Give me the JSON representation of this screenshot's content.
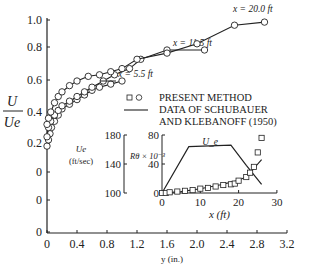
{
  "chart_data": [
    {
      "type": "line",
      "title": "",
      "xlabel": "y (in.)",
      "ylabel": "U / U_e",
      "xlim": [
        0,
        3.2
      ],
      "ylim": [
        0,
        1.0
      ],
      "x_ticks": [
        "0",
        "0.4",
        "0.8",
        "1.2",
        "1.6",
        "2.0",
        "2.4",
        "2.8",
        "3.2"
      ],
      "y_ticks": [
        "1.0",
        "0.8",
        "0.6",
        "0.4",
        "0.2",
        "0",
        "0",
        "0"
      ],
      "grid": false,
      "legend": {
        "position": "right-middle",
        "entries": [
          {
            "symbol": "□,○",
            "label": "PRESENT METHOD"
          },
          {
            "symbol": "line",
            "label": "DATA OF SCHUBAUER AND KLEBANOFF (1950)"
          }
        ]
      },
      "series": [
        {
          "name": "x = 5.5 ft",
          "annotation": "x = 5.5 ft",
          "x": [
            0.0,
            0.02,
            0.04,
            0.06,
            0.1,
            0.15,
            0.2,
            0.3,
            0.4,
            0.5,
            0.6,
            0.7,
            0.85,
            1.0
          ],
          "y": [
            0.18,
            0.22,
            0.26,
            0.3,
            0.34,
            0.38,
            0.42,
            0.45,
            0.48,
            0.51,
            0.54,
            0.56,
            0.58,
            0.6
          ]
        },
        {
          "name": "x = 11.5 ft",
          "annotation": "x = 11.5 ft",
          "x": [
            0.0,
            0.02,
            0.05,
            0.1,
            0.15,
            0.2,
            0.3,
            0.4,
            0.5,
            0.6,
            0.75,
            0.9,
            1.1,
            1.25,
            1.6,
            2.1
          ],
          "y": [
            0.24,
            0.3,
            0.34,
            0.38,
            0.41,
            0.44,
            0.47,
            0.5,
            0.53,
            0.56,
            0.6,
            0.64,
            0.68,
            0.74,
            0.8,
            0.8
          ]
        },
        {
          "name": "x = 20.0 ft",
          "annotation": "x = 20.0 ft",
          "x": [
            0.0,
            0.02,
            0.05,
            0.1,
            0.15,
            0.2,
            0.3,
            0.4,
            0.55,
            0.7,
            0.85,
            1.0,
            1.2,
            1.6,
            2.0,
            2.5,
            2.9
          ],
          "y": [
            0.32,
            0.36,
            0.4,
            0.46,
            0.5,
            0.53,
            0.57,
            0.6,
            0.63,
            0.64,
            0.66,
            0.68,
            0.74,
            0.78,
            0.84,
            0.96,
            0.98
          ]
        }
      ]
    },
    {
      "type": "line",
      "title": "inset",
      "xlabel": "x (ft)",
      "ylabel_left": "U_e (ft/sec)",
      "ylabel_right": "Rθ × 10^-3",
      "xlim": [
        0,
        30
      ],
      "ylim_left": [
        100,
        180
      ],
      "ylim_right": [
        0,
        80
      ],
      "x_ticks": [
        "0",
        "10",
        "20",
        "30"
      ],
      "y_ticks_left": [
        "180",
        "140",
        "100"
      ],
      "y_ticks_right": [
        "80",
        "40",
        "0"
      ],
      "annotation": "U_e",
      "series": [
        {
          "name": "U_e (line)",
          "x": [
            0,
            7,
            18,
            22,
            26
          ],
          "y": [
            100,
            164,
            166,
            138,
            112
          ]
        },
        {
          "name": "Rθ × 10^-3 (line)",
          "x": [
            0,
            5,
            10,
            15,
            19,
            22,
            26
          ],
          "y": [
            0,
            2,
            6,
            11,
            16,
            22,
            46
          ]
        },
        {
          "name": "Rθ × 10^-3 (squares)",
          "x": [
            0,
            1,
            2,
            4,
            6,
            8,
            10,
            12,
            14,
            16,
            18,
            19,
            20,
            22,
            23,
            24,
            25,
            26
          ],
          "y": [
            0,
            0,
            1,
            2,
            3,
            4,
            6,
            7,
            9,
            11,
            12,
            13,
            17,
            22,
            28,
            36,
            56,
            76
          ]
        }
      ]
    }
  ]
}
